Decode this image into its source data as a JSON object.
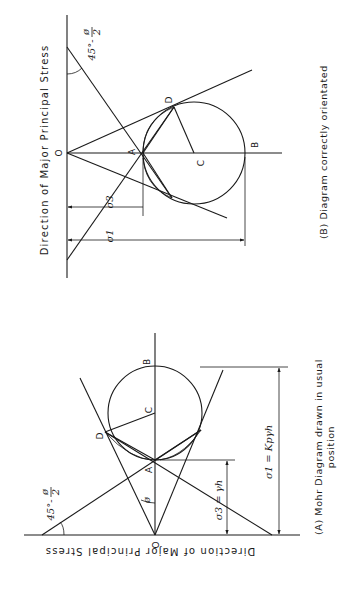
{
  "figure": {
    "diagram_b": {
      "direction_label": "Direction of Major Principal Stress",
      "angle_label": "45°-ø/2",
      "angle_main": "45°-",
      "angle_num": "ø",
      "angle_den": "2",
      "points": {
        "O": "O",
        "A": "A",
        "C": "C",
        "B": "B",
        "D": "D"
      },
      "sigma3_label": "σ3",
      "sigma1_label": "σ1",
      "caption": "(B) Diagram correctly orientated"
    },
    "diagram_a": {
      "direction_label": "Direction of Major Principal Stress",
      "angle_label": "45°-ø/2",
      "angle_main": "45°-",
      "angle_num": "ø",
      "angle_den": "2",
      "phi_label": "ø",
      "points": {
        "O": "O",
        "A": "A",
        "C": "C",
        "B": "B",
        "D": "D"
      },
      "sigma3_label": "σ3 = γh",
      "sigma1_label": "σ1 = Kpγh",
      "caption_line1": "(A) Mohr Diagram drawn in usual",
      "caption_line2": "position"
    }
  }
}
